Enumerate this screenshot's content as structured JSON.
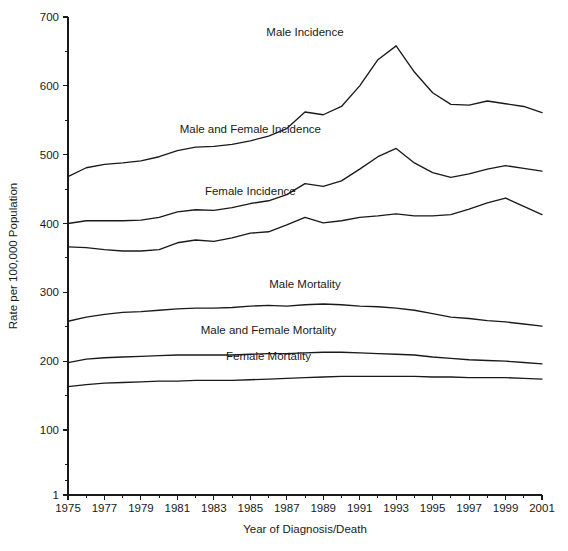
{
  "chart_data": {
    "type": "line",
    "title": "",
    "xlabel": "Year of Diagnosis/Death",
    "ylabel": "Rate per 100,000 Population",
    "xlim": [
      1975,
      2001
    ],
    "ylim": [
      1,
      700
    ],
    "grid": false,
    "legend_position": "inline-labels",
    "x_tick_labels": [
      "1975",
      "1977",
      "1979",
      "1981",
      "1983",
      "1985",
      "1987",
      "1989",
      "1991",
      "1993",
      "1995",
      "1997",
      "1999",
      "2001"
    ],
    "x_tick_values": [
      1975,
      1977,
      1979,
      1981,
      1983,
      1985,
      1987,
      1989,
      1991,
      1993,
      1995,
      1997,
      1999,
      2001
    ],
    "x_minor_ticks": [
      1976,
      1978,
      1980,
      1982,
      1984,
      1986,
      1988,
      1990,
      1992,
      1994,
      1996,
      1998,
      2000
    ],
    "y_tick_labels": [
      "1",
      "100",
      "200",
      "300",
      "400",
      "500",
      "600",
      "700"
    ],
    "y_tick_values": [
      1,
      100,
      200,
      300,
      400,
      500,
      600,
      700
    ],
    "y_minor_ticks": [
      50,
      150,
      250,
      350,
      450,
      550,
      650
    ],
    "x": [
      1975,
      1976,
      1977,
      1978,
      1979,
      1980,
      1981,
      1982,
      1983,
      1984,
      1985,
      1986,
      1987,
      1988,
      1989,
      1990,
      1991,
      1992,
      1993,
      1994,
      1995,
      1996,
      1997,
      1998,
      1999,
      2000,
      2001
    ],
    "series": [
      {
        "name": "Male Incidence",
        "label_x": 1988,
        "label_y": 672,
        "values": [
          468,
          481,
          486,
          488,
          491,
          497,
          506,
          511,
          512,
          515,
          520,
          527,
          538,
          562,
          558,
          570,
          600,
          638,
          658,
          620,
          590,
          573,
          572,
          578,
          574,
          570,
          561
        ]
      },
      {
        "name": "Male and Female Incidence",
        "label_x": 1985,
        "label_y": 532,
        "values": [
          400,
          404,
          404,
          404,
          405,
          409,
          417,
          420,
          419,
          423,
          429,
          433,
          442,
          458,
          454,
          462,
          479,
          497,
          509,
          488,
          474,
          467,
          472,
          479,
          484,
          480,
          476
        ]
      },
      {
        "name": "Female Incidence",
        "label_x": 1985,
        "label_y": 442,
        "values": [
          366,
          365,
          362,
          360,
          360,
          362,
          372,
          376,
          374,
          379,
          386,
          388,
          398,
          409,
          401,
          404,
          409,
          411,
          414,
          411,
          411,
          413,
          421,
          430,
          437,
          425,
          413
        ]
      },
      {
        "name": "Male Mortality",
        "label_x": 1988,
        "label_y": 306,
        "values": [
          258,
          264,
          268,
          271,
          272,
          274,
          276,
          277,
          277,
          278,
          280,
          281,
          280,
          282,
          283,
          282,
          280,
          279,
          277,
          274,
          269,
          264,
          262,
          259,
          257,
          254,
          251
        ]
      },
      {
        "name": "Male and Female Mortality",
        "label_x": 1986,
        "label_y": 239,
        "values": [
          198,
          203,
          205,
          206,
          207,
          208,
          209,
          209,
          209,
          209,
          210,
          211,
          211,
          212,
          213,
          213,
          212,
          211,
          210,
          209,
          206,
          204,
          202,
          201,
          200,
          198,
          196
        ]
      },
      {
        "name": "Female Mortality",
        "label_x": 1986,
        "label_y": 202,
        "values": [
          163,
          166,
          168,
          169,
          170,
          171,
          171,
          172,
          172,
          172,
          173,
          174,
          175,
          176,
          177,
          178,
          178,
          178,
          178,
          178,
          177,
          177,
          176,
          176,
          176,
          175,
          174
        ]
      }
    ]
  }
}
